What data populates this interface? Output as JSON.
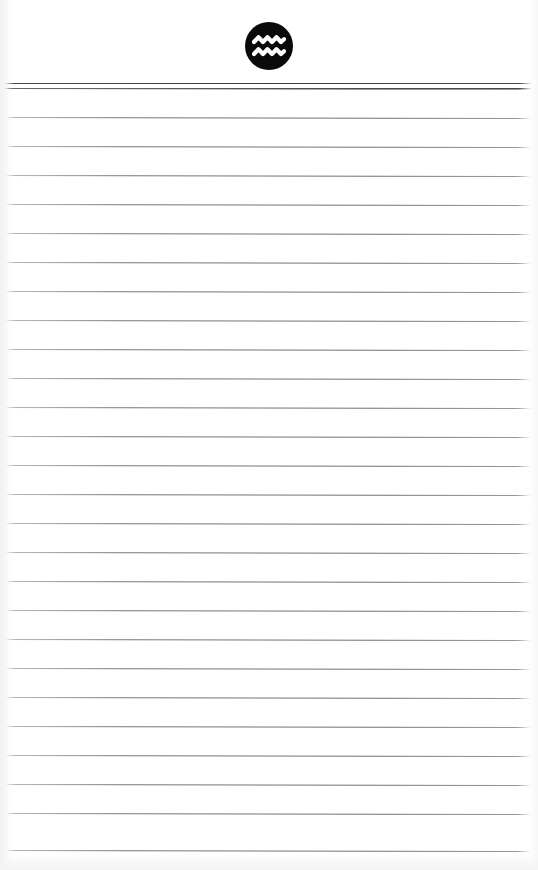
{
  "document": {
    "kind": "ruled-notepad-page",
    "page_width": 538,
    "page_height": 870,
    "background_color": "#ffffff",
    "body_text": ""
  },
  "logo": {
    "name": "aquarius-logo",
    "symbol": "aquarius-waves",
    "shape": "filled-circle",
    "circle_color": "#0a0a0a",
    "glyph_color": "#ffffff",
    "diameter_px": 48,
    "center_x": 270,
    "top_y": 22,
    "wave_count": 2,
    "peaks_per_wave": 3,
    "alt_text": "Aquarius wave symbol in a black circle"
  },
  "header_rule": {
    "name": "header-double-rule",
    "line_count": 2,
    "color": "#3c3c3c",
    "top_y": 83,
    "gap_px": 5,
    "left_inset": 4,
    "right_inset": 6
  },
  "ruling": {
    "name": "ruled-writing-lines",
    "color": "#6e6e72",
    "thickness_px": 1,
    "spacing_px": 29,
    "first_line_y": 88,
    "last_line_y": 850,
    "line_count": 27,
    "left_inset": 5,
    "right_inset": 7,
    "line_y_positions": [
      88,
      117,
      146,
      175,
      204,
      233,
      262,
      291,
      320,
      349,
      378,
      407,
      436,
      465,
      494,
      523,
      552,
      581,
      610,
      639,
      668,
      697,
      726,
      755,
      784,
      813,
      850
    ],
    "line_tilt_deg": 0.12
  }
}
